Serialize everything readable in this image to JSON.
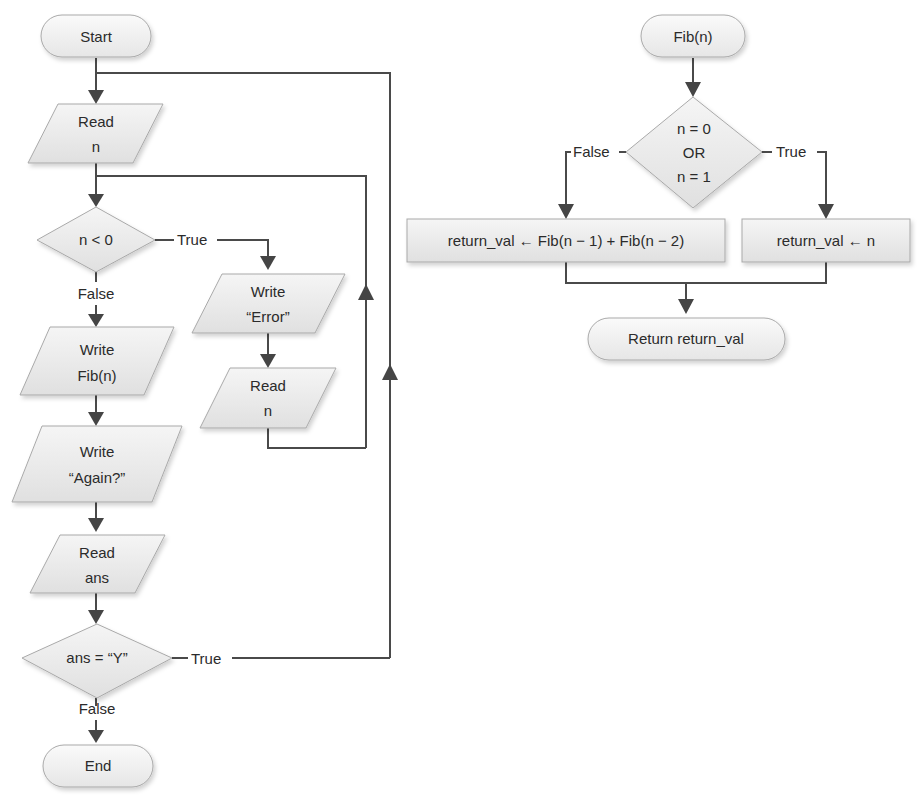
{
  "caption_fragment": "... program ... Fibonacci ... it performs the following ...",
  "main_flow": {
    "start": "Start",
    "read_n": [
      "Read",
      "n"
    ],
    "cond_negative": "n < 0",
    "cond_negative_true": "True",
    "cond_negative_false": "False",
    "write_error": [
      "Write",
      "“Error”"
    ],
    "reread_n": [
      "Read",
      "n"
    ],
    "write_fib": [
      "Write",
      "Fib(n)"
    ],
    "write_again": [
      "Write",
      "“Again?”"
    ],
    "read_ans": [
      "Read",
      "ans"
    ],
    "cond_again": "ans = “Y”",
    "cond_again_true": "True",
    "cond_again_false": "False",
    "end": "End"
  },
  "fib_flow": {
    "start": "Fib(n)",
    "cond_base": [
      "n = 0",
      "OR",
      "n = 1"
    ],
    "cond_base_false": "False",
    "cond_base_true": "True",
    "recursive_step": "return_val ← Fib(n − 1) + Fib(n − 2)",
    "base_step": "return_val ← n",
    "return": "Return return_val"
  },
  "colors": {
    "shape_fill_top": "#f4f4f4",
    "shape_fill_bottom": "#e2e2e2",
    "connector": "#4a4a4a",
    "text": "#2b2b2b"
  }
}
